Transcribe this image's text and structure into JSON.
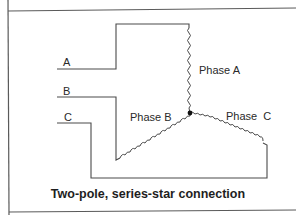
{
  "diagram": {
    "terminals": [
      {
        "id": "A",
        "label": "A"
      },
      {
        "id": "B",
        "label": "B"
      },
      {
        "id": "C",
        "label": "C"
      }
    ],
    "windings": [
      {
        "id": "phase-a",
        "label": "Phase A"
      },
      {
        "id": "phase-b",
        "label": "Phase B"
      },
      {
        "id": "phase-c",
        "label": "Phase C"
      }
    ],
    "junction": "star-point",
    "caption": "Two-pole, series-star connection",
    "colors": {
      "line": "#4a4a4a",
      "background": "#ffffff",
      "text": "#2a2a2a"
    }
  }
}
